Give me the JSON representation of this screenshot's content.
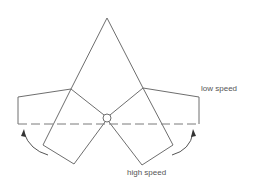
{
  "diagram": {
    "labels": {
      "low_speed": "low speed",
      "high_speed": "high speed"
    },
    "colors": {
      "line": "#6e6e6e",
      "text": "#555555",
      "background": "#ffffff"
    }
  }
}
